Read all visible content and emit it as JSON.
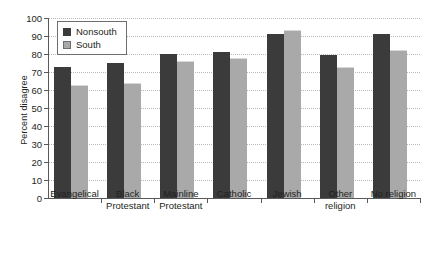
{
  "chart_data": {
    "type": "bar",
    "title": "",
    "xlabel": "",
    "ylabel": "Percent disagree",
    "ylim": [
      0,
      100
    ],
    "ytick_step": 10,
    "yticks": [
      0,
      10,
      20,
      30,
      40,
      50,
      60,
      70,
      80,
      90,
      100
    ],
    "grid": true,
    "legend_position": "top-left",
    "categories": [
      "Evangelical",
      "Black\nProtestant",
      "Mainline\nProtestant",
      "Catholic",
      "Jewish",
      "Other\nreligion",
      "No religion"
    ],
    "series": [
      {
        "name": "Nonsouth",
        "color": "#3b3b3b",
        "values": [
          73,
          75,
          80,
          81,
          91,
          79.5,
          91
        ]
      },
      {
        "name": "South",
        "color": "#a9a9a9",
        "values": [
          63,
          64,
          76,
          78,
          93.5,
          73,
          82
        ]
      }
    ]
  },
  "legend": {
    "items": [
      {
        "label": "Nonsouth",
        "swatch": "nonsouth"
      },
      {
        "label": "South",
        "swatch": "south"
      }
    ]
  },
  "axis": {
    "y_title": "Percent disagree"
  }
}
